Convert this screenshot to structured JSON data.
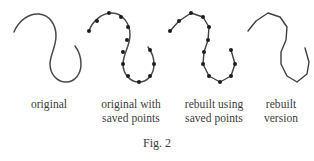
{
  "figure": {
    "caption": "Fig. 2",
    "stroke_color": "#4a4a4a",
    "point_color": "#1d1d1d",
    "background": "#ffffff",
    "panels": [
      {
        "id": "original",
        "label_line1": "original",
        "label_line2": "",
        "render": "smooth-curve",
        "path": "M 14,32 C 18,22 28,13 39,14 C 50,15 56,25 56,36 C 56,47 50,55 50,64 C 50,74 57,82 66,82 C 75,82 81,74 81,64 C 81,56 78,50 75,46"
      },
      {
        "id": "original-with-saved-points",
        "label_line1": "original with",
        "label_line2": "saved points",
        "render": "smooth-curve-with-points",
        "path": "M 89,31 C 92,22 101,13 112,13 C 123,13 130,24 130,35 C 130,46 123,54 123,64 C 123,74 130,82 139,82 C 148,82 154,74 154,64 C 154,57 151,51 148,47",
        "points": [
          {
            "x": 89,
            "y": 31
          },
          {
            "x": 97,
            "y": 21
          },
          {
            "x": 109,
            "y": 13
          },
          {
            "x": 121,
            "y": 17
          },
          {
            "x": 128,
            "y": 27
          },
          {
            "x": 127,
            "y": 40
          },
          {
            "x": 123,
            "y": 52
          },
          {
            "x": 123,
            "y": 64
          },
          {
            "x": 128,
            "y": 76
          },
          {
            "x": 139,
            "y": 82
          },
          {
            "x": 150,
            "y": 76
          },
          {
            "x": 154,
            "y": 64
          },
          {
            "x": 150,
            "y": 50
          }
        ]
      },
      {
        "id": "rebuilt-using-saved-points",
        "label_line1": "rebuilt using",
        "label_line2": "saved points",
        "render": "polyline-with-points",
        "points": [
          {
            "x": 170,
            "y": 31
          },
          {
            "x": 179,
            "y": 21
          },
          {
            "x": 191,
            "y": 13
          },
          {
            "x": 203,
            "y": 17
          },
          {
            "x": 209,
            "y": 27
          },
          {
            "x": 208,
            "y": 40
          },
          {
            "x": 204,
            "y": 52
          },
          {
            "x": 203,
            "y": 64
          },
          {
            "x": 209,
            "y": 76
          },
          {
            "x": 220,
            "y": 82
          },
          {
            "x": 231,
            "y": 76
          },
          {
            "x": 235,
            "y": 64
          },
          {
            "x": 231,
            "y": 50
          }
        ]
      },
      {
        "id": "rebuilt-version",
        "label_line1": "rebuilt",
        "label_line2": "version",
        "render": "polyline",
        "points": [
          {
            "x": 248,
            "y": 31
          },
          {
            "x": 256,
            "y": 21
          },
          {
            "x": 268,
            "y": 13
          },
          {
            "x": 280,
            "y": 17
          },
          {
            "x": 287,
            "y": 27
          },
          {
            "x": 286,
            "y": 40
          },
          {
            "x": 281,
            "y": 52
          },
          {
            "x": 281,
            "y": 64
          },
          {
            "x": 287,
            "y": 76
          },
          {
            "x": 297,
            "y": 82
          },
          {
            "x": 307,
            "y": 74
          },
          {
            "x": 309,
            "y": 62
          },
          {
            "x": 305,
            "y": 48
          }
        ]
      }
    ]
  }
}
